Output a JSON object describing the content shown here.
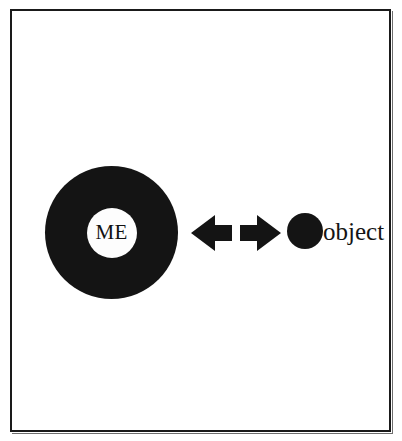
{
  "figure": {
    "background_color": "#ffffff",
    "ink_color": "#141414",
    "frame": {
      "name": "outer-border",
      "color": "#1a1a1a"
    },
    "self_node": {
      "label": "ME",
      "shape": "annulus",
      "fill_color": "#141414",
      "core_color": "#fdfdfd"
    },
    "relation": {
      "name": "bidirectional-arrows",
      "left_arrow_direction": "left",
      "right_arrow_direction": "right",
      "color": "#141414"
    },
    "object_node": {
      "label": "object",
      "shape": "disc",
      "fill_color": "#141414"
    }
  }
}
